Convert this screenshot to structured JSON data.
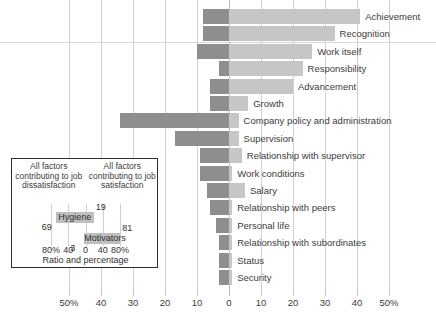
{
  "chart_data": {
    "type": "bar",
    "title": "",
    "subtitle": "",
    "xlabel": "",
    "ylabel": "",
    "orientation": "horizontal-diverging",
    "grid": true,
    "legend_position": "inset-lower-left",
    "xlim": [
      -50,
      50
    ],
    "xtick_labels_left": [
      "50%",
      "40",
      "30",
      "20",
      "10",
      "0"
    ],
    "xtick_labels_right": [
      "10",
      "20",
      "30",
      "40",
      "50%"
    ],
    "xticks": [
      -50,
      -40,
      -30,
      -20,
      -10,
      0,
      10,
      20,
      30,
      40,
      50
    ],
    "series": [
      {
        "name": "Percentage frequency low (job dissatisfaction)",
        "color": "#8e8e8e"
      },
      {
        "name": "Percentage frequency high (job satisfaction)",
        "color": "#c6c6c6"
      }
    ],
    "categories": [
      "Achievement",
      "Recognition",
      "Work itself",
      "Responsibility",
      "Advancement",
      "Growth",
      "Company policy and administration",
      "Supervision",
      "Relationship with supervisor",
      "Work conditions",
      "Salary",
      "Relationship with peers",
      "Personal life",
      "Relationship with subordinates",
      "Status",
      "Security"
    ],
    "bars": [
      {
        "category": "Achievement",
        "dissatisfaction": 8,
        "satisfaction": 41
      },
      {
        "category": "Recognition",
        "dissatisfaction": 8,
        "satisfaction": 33
      },
      {
        "category": "Work itself",
        "dissatisfaction": 10,
        "satisfaction": 26
      },
      {
        "category": "Responsibility",
        "dissatisfaction": 3,
        "satisfaction": 23
      },
      {
        "category": "Advancement",
        "dissatisfaction": 6,
        "satisfaction": 20
      },
      {
        "category": "Growth",
        "dissatisfaction": 6,
        "satisfaction": 6
      },
      {
        "category": "Company policy and administration",
        "dissatisfaction": 34,
        "satisfaction": 3
      },
      {
        "category": "Supervision",
        "dissatisfaction": 17,
        "satisfaction": 3
      },
      {
        "category": "Relationship with supervisor",
        "dissatisfaction": 9,
        "satisfaction": 4
      },
      {
        "category": "Work conditions",
        "dissatisfaction": 9,
        "satisfaction": 1
      },
      {
        "category": "Salary",
        "dissatisfaction": 7,
        "satisfaction": 5
      },
      {
        "category": "Relationship with peers",
        "dissatisfaction": 6,
        "satisfaction": 1
      },
      {
        "category": "Personal life",
        "dissatisfaction": 4,
        "satisfaction": 1
      },
      {
        "category": "Relationship with subordinates",
        "dissatisfaction": 3,
        "satisfaction": 1
      },
      {
        "category": "Status",
        "dissatisfaction": 3,
        "satisfaction": 1
      },
      {
        "category": "Security",
        "dissatisfaction": 3,
        "satisfaction": 1
      }
    ],
    "inset": {
      "heading_left": "All factors contributing to job dissatisfaction",
      "heading_right": "All factors contributing to job satisfaction",
      "caption": "Ratio and percentage",
      "xticks": [
        -80,
        -40,
        0,
        40,
        80
      ],
      "xtick_labels": [
        "80%",
        "40",
        "0",
        "40",
        "80%"
      ],
      "xlim": [
        -100,
        100
      ],
      "bars": [
        {
          "label": "Hygiene",
          "dissatisfaction": 69,
          "satisfaction": 19
        },
        {
          "label": "Motivators",
          "dissatisfaction": 3,
          "satisfaction": 81
        }
      ]
    }
  },
  "colors": {
    "bar_dissatisfaction": "#8e8e8e",
    "bar_satisfaction": "#c6c6c6",
    "gridline": "#d2d2d2",
    "text": "#3c3c3c",
    "inset_border": "#2d2d2d",
    "inset_bar": "#bfbfbf"
  }
}
